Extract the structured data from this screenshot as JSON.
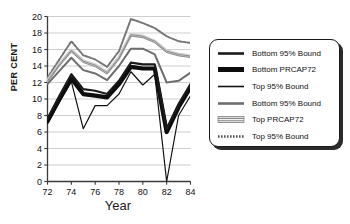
{
  "chart_data": {
    "type": "line",
    "title": "",
    "xlabel": "Year",
    "ylabel": "PER CENT",
    "xlim": [
      72,
      84
    ],
    "ylim": [
      0,
      20
    ],
    "xticks": [
      72,
      74,
      76,
      78,
      80,
      82,
      84
    ],
    "yticks": [
      0,
      2,
      4,
      6,
      8,
      10,
      12,
      14,
      16,
      18,
      20
    ],
    "grid": true,
    "legend_position": "right",
    "x": [
      72,
      73,
      74,
      75,
      76,
      77,
      78,
      79,
      80,
      81,
      82,
      83,
      84
    ],
    "series": [
      {
        "name": "Bottom 95% Bound",
        "style": "medium-black",
        "color": "#1a1a1a",
        "width": 2.2,
        "dash": "",
        "values": [
          7.6,
          10.4,
          13.0,
          11.2,
          11.0,
          10.6,
          12.2,
          14.4,
          14.2,
          14.2,
          6.4,
          9.4,
          11.8
        ]
      },
      {
        "name": "Bottom PRCAP72",
        "style": "thick-black",
        "color": "#0d0d0d",
        "width": 4.2,
        "dash": "",
        "values": [
          7.3,
          10.0,
          12.5,
          10.6,
          10.4,
          10.2,
          11.8,
          13.9,
          13.7,
          13.7,
          6.0,
          9.0,
          11.4
        ]
      },
      {
        "name": "Top 95% Bound",
        "style": "thin-black",
        "color": "#111111",
        "width": 1.2,
        "dash": "",
        "values": [
          7.0,
          9.6,
          12.1,
          6.4,
          9.2,
          9.2,
          10.6,
          13.3,
          11.7,
          13.0,
          0.0,
          8.0,
          10.4
        ]
      },
      {
        "name": "Bottom 95% Bound",
        "style": "gray-solid",
        "color": "#6e6e6e",
        "width": 2.0,
        "dash": "",
        "values": [
          11.8,
          13.4,
          15.0,
          13.5,
          13.1,
          12.3,
          14.0,
          16.1,
          16.1,
          15.4,
          12.0,
          12.2,
          13.2
        ]
      },
      {
        "name": "Top PRCAP72",
        "style": "gray-striped",
        "color": "#8a8a8a",
        "width": 3.4,
        "dash": "",
        "values": [
          12.2,
          14.2,
          15.9,
          14.6,
          14.1,
          13.2,
          15.0,
          17.8,
          17.6,
          17.0,
          15.8,
          15.4,
          15.2
        ]
      },
      {
        "name": "Top 95% Bound",
        "style": "gray-dotted",
        "color": "#767676",
        "width": 2.0,
        "dash": "2.4,1.6",
        "values": [
          12.6,
          14.8,
          17.0,
          15.3,
          14.8,
          13.9,
          15.8,
          19.7,
          19.2,
          18.6,
          17.6,
          17.0,
          16.8
        ]
      }
    ],
    "legend": [
      {
        "label": "Bottom 95% Bound",
        "swatch": "medium-black"
      },
      {
        "label": "Bottom PRCAP72",
        "swatch": "thick-black"
      },
      {
        "label": "Top 95% Bound",
        "swatch": "thin-black"
      },
      {
        "label": "Bottom 95% Bound",
        "swatch": "gray-solid"
      },
      {
        "label": "Top PRCAP72",
        "swatch": "gray-striped"
      },
      {
        "label": "Top 95% Bound",
        "swatch": "gray-dotted"
      }
    ]
  }
}
